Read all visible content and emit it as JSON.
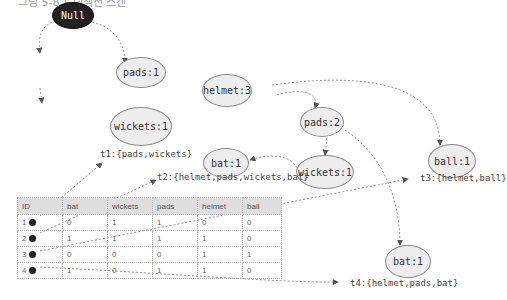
{
  "caption": "그림 5-8 트랜잭션 스캔",
  "tree": {
    "nodes": [
      {
        "id": "root",
        "label": "Null"
      },
      {
        "id": "pads1",
        "label": "pads:1"
      },
      {
        "id": "helmet3",
        "label": "helmet:3"
      },
      {
        "id": "wickets1a",
        "label": "wickets:1"
      },
      {
        "id": "pads2",
        "label": "pads:2"
      },
      {
        "id": "ball1",
        "label": "ball:1"
      },
      {
        "id": "bat1a",
        "label": "bat:1"
      },
      {
        "id": "wickets1b",
        "label": "wickets:1"
      },
      {
        "id": "bat1b",
        "label": "bat:1"
      }
    ],
    "transactions": [
      {
        "id": "t1",
        "label": "t1:{pads,wickets}"
      },
      {
        "id": "t2",
        "label": "t2:{helmet,pads,wickets,bat}"
      },
      {
        "id": "t3",
        "label": "t3:{helmet,ball}"
      },
      {
        "id": "t4",
        "label": "t4:{helmet,pads,bat}"
      }
    ]
  },
  "table": {
    "headers": [
      "ID",
      "bat",
      "wickets",
      "pads",
      "helmet",
      "ball"
    ],
    "rows": [
      {
        "id": "1",
        "values": [
          "0",
          "1",
          "1",
          "0",
          "0"
        ]
      },
      {
        "id": "2",
        "values": [
          "1",
          "1",
          "1",
          "1",
          "0"
        ]
      },
      {
        "id": "3",
        "values": [
          "0",
          "0",
          "0",
          "1",
          "1"
        ]
      },
      {
        "id": "4",
        "values": [
          "1",
          "0",
          "1",
          "1",
          "0"
        ]
      }
    ]
  },
  "colors": {
    "node_fill": "#ededed",
    "root_fill": "#222222",
    "edge": "#888888",
    "header_fill": "#dedede"
  }
}
